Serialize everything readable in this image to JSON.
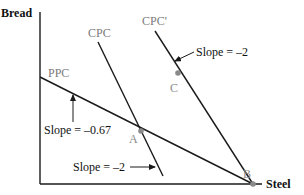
{
  "axes": {
    "y_label": "Bread",
    "x_label": "Steel"
  },
  "curves": {
    "ppc": {
      "label": "PPC"
    },
    "cpc": {
      "label": "CPC"
    },
    "cpc_prime": {
      "label": "CPC'"
    }
  },
  "points": {
    "a": {
      "label": "A"
    },
    "b": {
      "label": "B"
    },
    "c": {
      "label": "C"
    }
  },
  "annotations": {
    "slope_ppc": "Slope = –0.67",
    "slope_cpc": "Slope = –2",
    "slope_cpc_prime": "Slope = –2"
  },
  "colors": {
    "line": "#1a1a1a",
    "curve_label": "#7a7a7a",
    "point": "#8a8a8a"
  }
}
